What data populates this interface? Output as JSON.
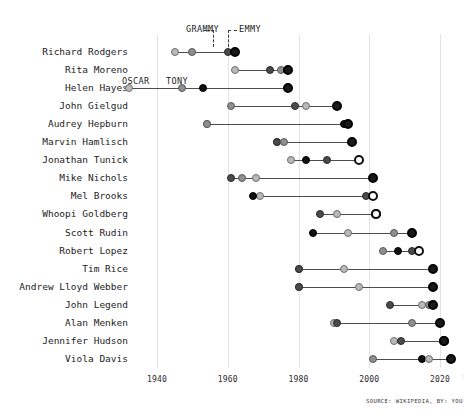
{
  "chart_data": {
    "type": "scatter",
    "title": "",
    "subtitle": "",
    "xlabel": "",
    "ylabel": "",
    "xlim": [
      1930,
      2025
    ],
    "grid": true,
    "legend_position": "inline-annotations",
    "x_ticks": [
      "1940",
      "1960",
      "1980",
      "2000",
      "2020"
    ],
    "x_tick_values": [
      1940,
      1960,
      1980,
      2000,
      2020
    ],
    "award_types": [
      "OSCAR",
      "TONY",
      "GRAMMY",
      "EMMY"
    ],
    "categories": [
      "Richard Rodgers",
      "Rita Moreno",
      "Helen Hayes",
      "John Gielgud",
      "Audrey Hepburn",
      "Marvin Hamlisch",
      "Jonathan Tunick",
      "Mike Nichols",
      "Mel Brooks",
      "Whoopi Goldberg",
      "Scott Rudin",
      "Robert Lopez",
      "Tim Rice",
      "Andrew Lloyd Webber",
      "John Legend",
      "Alan Menken",
      "Jennifer Hudson",
      "Viola Davis"
    ],
    "rows": [
      {
        "name": "Richard Rodgers",
        "points": [
          {
            "award": "OSCAR",
            "year": 1945
          },
          {
            "award": "TONY",
            "year": 1950
          },
          {
            "award": "GRAMMY",
            "year": 1960
          },
          {
            "award": "EMMY",
            "year": 1962
          }
        ]
      },
      {
        "name": "Rita Moreno",
        "points": [
          {
            "award": "OSCAR",
            "year": 1962
          },
          {
            "award": "GRAMMY",
            "year": 1972
          },
          {
            "award": "EMMY",
            "year": 1977
          },
          {
            "award": "TONY",
            "year": 1975
          }
        ]
      },
      {
        "name": "Helen Hayes",
        "points": [
          {
            "award": "OSCAR",
            "year": 1932
          },
          {
            "award": "TONY",
            "year": 1947
          },
          {
            "award": "EMMY",
            "year": 1953
          },
          {
            "award": "GRAMMY",
            "year": 1977
          }
        ]
      },
      {
        "name": "John Gielgud",
        "points": [
          {
            "award": "TONY",
            "year": 1961
          },
          {
            "award": "EMMY",
            "year": 1991
          },
          {
            "award": "GRAMMY",
            "year": 1979
          },
          {
            "award": "OSCAR",
            "year": 1982
          }
        ]
      },
      {
        "name": "Audrey Hepburn",
        "points": [
          {
            "award": "OSCAR",
            "year": 1954
          },
          {
            "award": "TONY",
            "year": 1954
          },
          {
            "award": "EMMY",
            "year": 1993
          },
          {
            "award": "GRAMMY",
            "year": 1994
          }
        ]
      },
      {
        "name": "Marvin Hamlisch",
        "points": [
          {
            "award": "OSCAR",
            "year": 1974
          },
          {
            "award": "GRAMMY",
            "year": 1974
          },
          {
            "award": "TONY",
            "year": 1976
          },
          {
            "award": "EMMY",
            "year": 1995
          }
        ]
      },
      {
        "name": "Jonathan Tunick",
        "points": [
          {
            "award": "OSCAR",
            "year": 1978
          },
          {
            "award": "EMMY",
            "year": 1982
          },
          {
            "award": "GRAMMY",
            "year": 1988
          },
          {
            "award": "TONY",
            "year": 1997
          }
        ]
      },
      {
        "name": "Mike Nichols",
        "points": [
          {
            "award": "TONY",
            "year": 1964
          },
          {
            "award": "OSCAR",
            "year": 1968
          },
          {
            "award": "GRAMMY",
            "year": 1961
          },
          {
            "award": "EMMY",
            "year": 2001
          }
        ]
      },
      {
        "name": "Mel Brooks",
        "points": [
          {
            "award": "OSCAR",
            "year": 1969
          },
          {
            "award": "EMMY",
            "year": 1967
          },
          {
            "award": "GRAMMY",
            "year": 1999
          },
          {
            "award": "TONY",
            "year": 2001
          }
        ]
      },
      {
        "name": "Whoopi Goldberg",
        "points": [
          {
            "award": "GRAMMY",
            "year": 1986
          },
          {
            "award": "OSCAR",
            "year": 1991
          },
          {
            "award": "EMMY",
            "year": 2002
          },
          {
            "award": "TONY",
            "year": 2002
          }
        ]
      },
      {
        "name": "Scott Rudin",
        "points": [
          {
            "award": "EMMY",
            "year": 1984
          },
          {
            "award": "OSCAR",
            "year": 1994
          },
          {
            "award": "TONY",
            "year": 2007
          },
          {
            "award": "GRAMMY",
            "year": 2012
          }
        ]
      },
      {
        "name": "Robert Lopez",
        "points": [
          {
            "award": "TONY",
            "year": 2004
          },
          {
            "award": "EMMY",
            "year": 2008
          },
          {
            "award": "GRAMMY",
            "year": 2012
          },
          {
            "award": "OSCAR",
            "year": 2014
          }
        ]
      },
      {
        "name": "Tim Rice",
        "points": [
          {
            "award": "TONY",
            "year": 1980
          },
          {
            "award": "GRAMMY",
            "year": 1980
          },
          {
            "award": "OSCAR",
            "year": 1993
          },
          {
            "award": "EMMY",
            "year": 2018
          }
        ]
      },
      {
        "name": "Andrew Lloyd Webber",
        "points": [
          {
            "award": "TONY",
            "year": 1980
          },
          {
            "award": "GRAMMY",
            "year": 1980
          },
          {
            "award": "OSCAR",
            "year": 1997
          },
          {
            "award": "EMMY",
            "year": 2018
          }
        ]
      },
      {
        "name": "John Legend",
        "points": [
          {
            "award": "GRAMMY",
            "year": 2006
          },
          {
            "award": "OSCAR",
            "year": 2015
          },
          {
            "award": "TONY",
            "year": 2017
          },
          {
            "award": "EMMY",
            "year": 2018
          }
        ]
      },
      {
        "name": "Alan Menken",
        "points": [
          {
            "award": "OSCAR",
            "year": 1990
          },
          {
            "award": "GRAMMY",
            "year": 1991
          },
          {
            "award": "TONY",
            "year": 2012
          },
          {
            "award": "EMMY",
            "year": 2020
          }
        ]
      },
      {
        "name": "Jennifer Hudson",
        "points": [
          {
            "award": "OSCAR",
            "year": 2007
          },
          {
            "award": "GRAMMY",
            "year": 2009
          },
          {
            "award": "TONY",
            "year": 2021
          },
          {
            "award": "EMMY",
            "year": 2021
          }
        ]
      },
      {
        "name": "Viola Davis",
        "points": [
          {
            "award": "TONY",
            "year": 2001
          },
          {
            "award": "EMMY",
            "year": 2015
          },
          {
            "award": "OSCAR",
            "year": 2017
          },
          {
            "award": "GRAMMY",
            "year": 2023
          }
        ]
      }
    ],
    "annotations": [
      {
        "label": "GRAMMY",
        "x_px": 186,
        "y_px": 24
      },
      {
        "label": "EMMY",
        "x_px": 239,
        "y_px": 24
      },
      {
        "label": "OSCAR",
        "x_px": 122,
        "y_px": 76
      },
      {
        "label": "TONY",
        "x_px": 166,
        "y_px": 76
      }
    ]
  },
  "source_note": "SOURCE: WIKIPEDIA, BY: YOU",
  "colors": {
    "oscar": "#b9b9b9",
    "tony": "#8f8f8f",
    "grammy": "#4a4a4a",
    "emmy": "#101010",
    "gridline": "#e3e3e3",
    "connector": "#4d4d4d",
    "text": "#1d1d1d",
    "background": "#ffffff"
  }
}
